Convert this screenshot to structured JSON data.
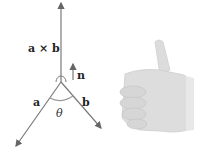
{
  "diagram": {
    "labels": {
      "cross_product": "a × b",
      "normal": "n",
      "vector_a": "a",
      "vector_b": "b",
      "angle": "θ"
    },
    "colors": {
      "line": "#7a7a7a",
      "text": "#222222",
      "hand": "#d9d9d9",
      "hand_shadow": "#c4c4c4"
    },
    "illustration": "right-hand-rule-thumbs-up"
  }
}
